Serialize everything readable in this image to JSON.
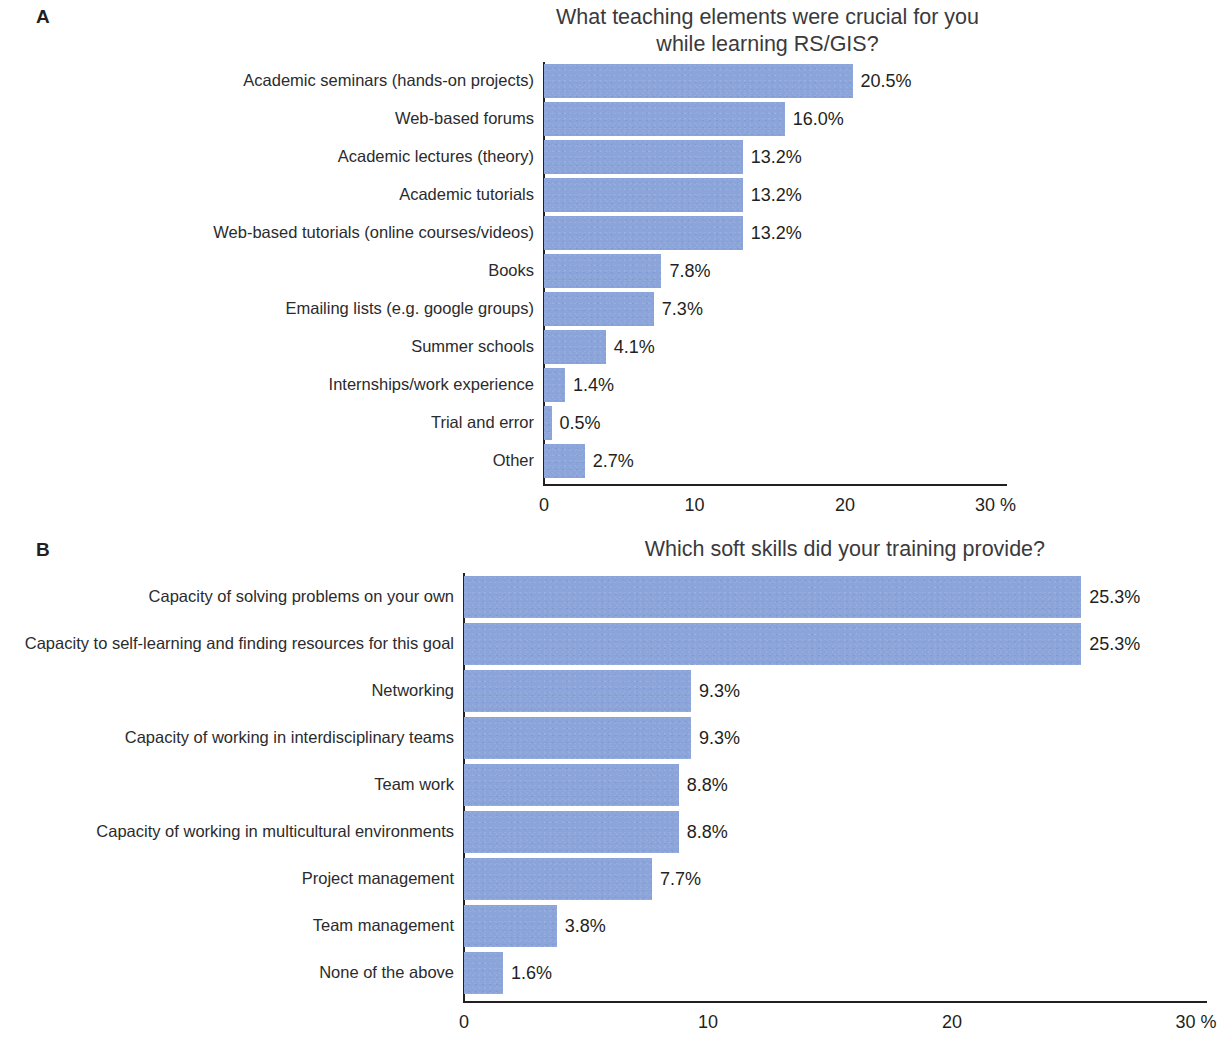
{
  "figure": {
    "background": "#ffffff",
    "bar_color": "#8ba4da",
    "axis_color": "#231f20",
    "text_color": "#231f20"
  },
  "panel_a": {
    "letter": "A",
    "title": "What teaching elements were crucial for you\nwhile learning RS/GIS?",
    "axis_unit": "%",
    "ticks": [
      "0",
      "10",
      "20",
      "30 %"
    ]
  },
  "panel_b": {
    "letter": "B",
    "title": "Which soft skills did your training provide?",
    "axis_unit": "%",
    "ticks": [
      "0",
      "10",
      "20",
      "30 %"
    ]
  },
  "chart_data": [
    {
      "type": "bar",
      "orientation": "horizontal",
      "panel": "A",
      "title": "What teaching elements were crucial for you while learning RS/GIS?",
      "xlabel": "30 %",
      "ylabel": "",
      "xlim": [
        0,
        30
      ],
      "xticks": [
        0,
        10,
        20,
        30
      ],
      "xticklabels": [
        "0",
        "10",
        "20",
        "30 %"
      ],
      "grid": false,
      "legend": "none",
      "categories": [
        "Academic seminars (hands-on projects)",
        "Web-based forums",
        "Academic lectures (theory)",
        "Academic tutorials",
        "Web-based tutorials (online courses/videos)",
        "Books",
        "Emailing lists (e.g. google groups)",
        "Summer schools",
        "Internships/work experience",
        "Trial and error",
        "Other"
      ],
      "values": [
        20.5,
        16.0,
        13.2,
        13.2,
        13.2,
        7.8,
        7.3,
        4.1,
        1.4,
        0.5,
        2.7
      ],
      "data_labels": [
        "20.5%",
        "16.0%",
        "13.2%",
        "13.2%",
        "13.2%",
        "7.8%",
        "7.3%",
        "4.1%",
        "1.4%",
        "0.5%",
        "2.7%"
      ]
    },
    {
      "type": "bar",
      "orientation": "horizontal",
      "panel": "B",
      "title": "Which soft skills did your training provide?",
      "xlabel": "30 %",
      "ylabel": "",
      "xlim": [
        0,
        30
      ],
      "xticks": [
        0,
        10,
        20,
        30
      ],
      "xticklabels": [
        "0",
        "10",
        "20",
        "30 %"
      ],
      "grid": false,
      "legend": "none",
      "categories": [
        "Capacity of solving problems on your own",
        "Capacity to self-learning and finding resources for this goal",
        "Networking",
        "Capacity of working in interdisciplinary teams",
        "Team work",
        "Capacity of working in multicultural environments",
        "Project management",
        "Team management",
        "None of the above"
      ],
      "values": [
        25.3,
        25.3,
        9.3,
        9.3,
        8.8,
        8.8,
        7.7,
        3.8,
        1.6
      ],
      "data_labels": [
        "25.3%",
        "25.3%",
        "9.3%",
        "9.3%",
        "8.8%",
        "8.8%",
        "7.7%",
        "3.8%",
        "1.6%"
      ]
    }
  ]
}
